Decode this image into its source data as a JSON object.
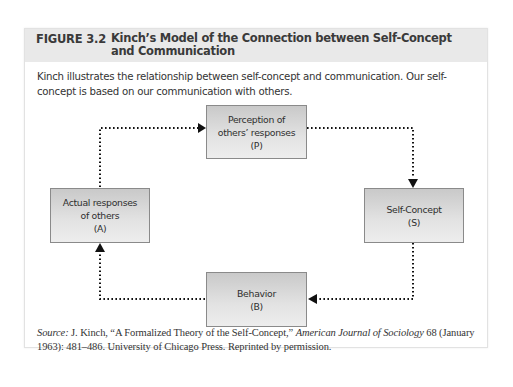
{
  "figure": {
    "label": "FIGURE 3.2",
    "title": "Kinch’s Model of the Connection between Self-Concept and Communication",
    "caption": "Kinch illustrates the relationship between self-concept and communication. Our self-concept is based on our communication with others."
  },
  "diagram": {
    "nodes": [
      {
        "id": "P",
        "lines": [
          "Perception of",
          "others’ responses",
          "(P)"
        ]
      },
      {
        "id": "S",
        "lines": [
          "Self-Concept",
          "(S)"
        ]
      },
      {
        "id": "B",
        "lines": [
          "Behavior",
          "(B)"
        ]
      },
      {
        "id": "A",
        "lines": [
          "Actual responses",
          "of others",
          "(A)"
        ]
      }
    ],
    "edges": [
      {
        "from": "A",
        "to": "P",
        "style": "dotted"
      },
      {
        "from": "P",
        "to": "S",
        "style": "dotted"
      },
      {
        "from": "S",
        "to": "B",
        "style": "dotted"
      },
      {
        "from": "B",
        "to": "A",
        "style": "dotted"
      }
    ]
  },
  "source": {
    "label": "Source:",
    "text_1": " J. Kinch, “A Formalized Theory of the Self-Concept,” ",
    "journal": "American Journal of Sociology",
    "text_2": " 68 (January 1963): 481–486. University of Chicago Press. Reprinted by permission."
  },
  "colors": {
    "header_bg": "#e9e9e9",
    "box_border": "#8a8a8a",
    "arrow": "#111111"
  }
}
